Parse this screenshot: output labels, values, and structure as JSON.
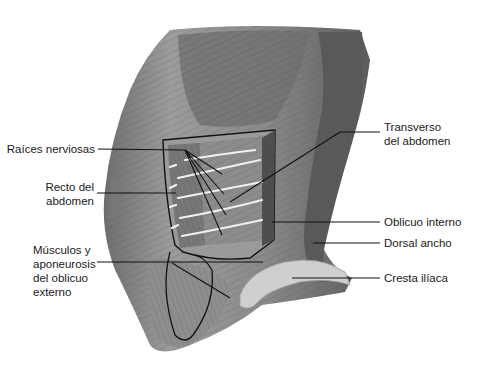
{
  "figure": {
    "colors": {
      "background": "#ffffff",
      "muscle_dark": "#5a5a5a",
      "muscle_mid": "#8a8a8a",
      "muscle_light": "#b9b9b9",
      "nerve": "#f2f2f2",
      "leader": "#111111"
    }
  },
  "labels": [
    {
      "id": "raices",
      "text": "Raíces nerviosas"
    },
    {
      "id": "recto",
      "text": "Recto del\nabdomen"
    },
    {
      "id": "musculos",
      "text": "Músculos y\naponeurosis\ndel oblicuo\nexterno"
    },
    {
      "id": "transverso",
      "text": "Transverso\ndel abdomen"
    },
    {
      "id": "oblicuo_interno",
      "text": "Oblicuo interno"
    },
    {
      "id": "dorsal",
      "text": "Dorsal ancho"
    },
    {
      "id": "cresta",
      "text": "Cresta ilíaca"
    }
  ]
}
